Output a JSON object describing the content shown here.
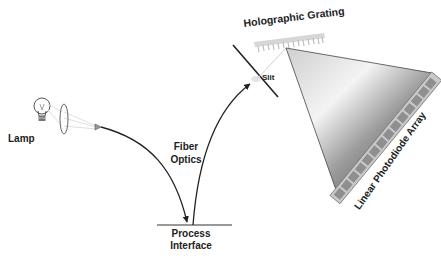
{
  "diagram": {
    "labels": {
      "lamp": "Lamp",
      "fiber_line1": "Fiber",
      "fiber_line2": "Optics",
      "process_line1": "Process",
      "process_line2": "Interface",
      "slit": "Slit",
      "grating": "Holographic Grating",
      "array": "Linear Photodiode Array"
    },
    "components": [
      {
        "id": "lamp",
        "icon": "lightbulb-icon"
      },
      {
        "id": "lens",
        "icon": "lens-icon"
      },
      {
        "id": "fiber-in",
        "icon": "fiber-curve"
      },
      {
        "id": "process-interface",
        "icon": "surface-line"
      },
      {
        "id": "fiber-out",
        "icon": "fiber-curve"
      },
      {
        "id": "slit",
        "icon": "slit-line"
      },
      {
        "id": "grating",
        "icon": "grating-icon"
      },
      {
        "id": "dispersed-light",
        "icon": "light-cone"
      },
      {
        "id": "photodiode-array",
        "icon": "detector-array-icon"
      }
    ],
    "photodiode_elements": 14,
    "colors": {
      "line": "#222222",
      "light_cone_dark": "#555555",
      "light_cone_light": "#f2f2f2",
      "array_fill": "#bdbdbd",
      "array_cell": "#8a8a8a",
      "grating": "#c8c8c8"
    }
  }
}
